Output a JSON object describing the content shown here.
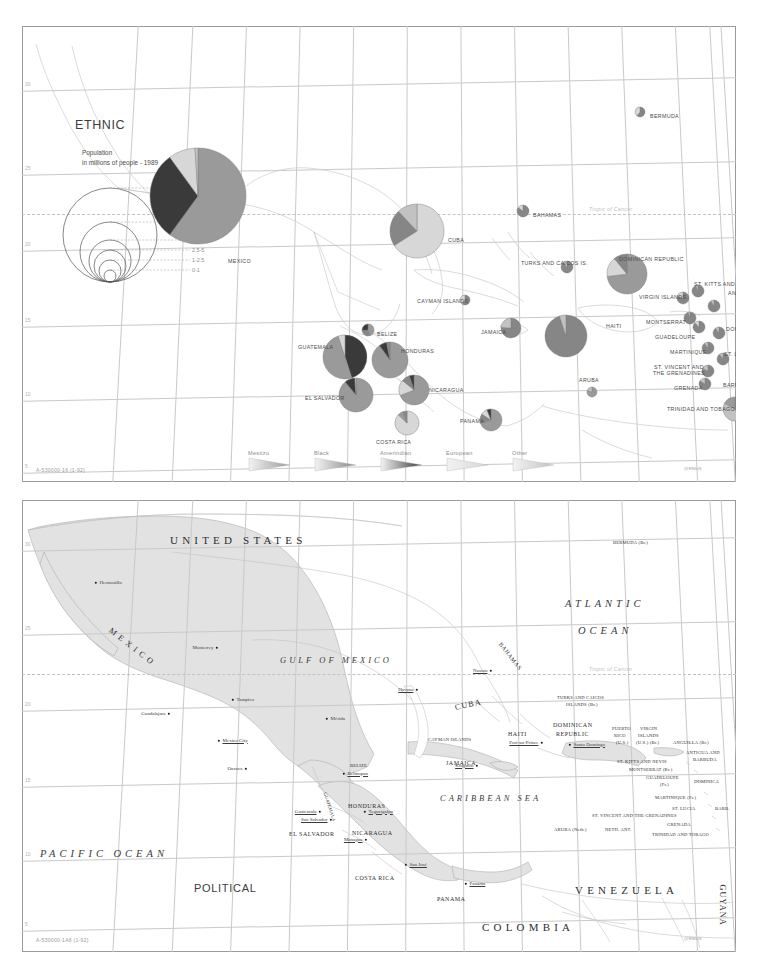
{
  "document": {
    "kind": "two-panel reference map sheet",
    "panels": [
      "ethnic",
      "political"
    ]
  },
  "ethnic": {
    "title": "ETHNIC",
    "population_caption_line1": "Population",
    "population_caption_line2": "in millions of people - 1989",
    "map_id": "A-530000-16   (1-92)",
    "credit": "@RMcN",
    "tropic_label": "Tropic of Cancer",
    "lon_ticks": [
      "115",
      "110",
      "105",
      "100",
      "95",
      "90",
      "85",
      "80",
      "75",
      "70",
      "65",
      "60",
      "55"
    ],
    "lat_ticks": [
      "30",
      "25",
      "20",
      "15",
      "10",
      "5"
    ],
    "size_key": [
      {
        "label": "25-100",
        "r": 47
      },
      {
        "label": "10-25",
        "r": 30
      },
      {
        "label": "5-10",
        "r": 21
      },
      {
        "label": "2.5-5",
        "r": 16
      },
      {
        "label": "1-2.5",
        "r": 11
      },
      {
        "label": "0-1",
        "r": 6
      }
    ],
    "legend": [
      {
        "label": "Mestizo",
        "color": "#9a9a9a"
      },
      {
        "label": "Black",
        "color": "#868686"
      },
      {
        "label": "Amerindian",
        "color": "#3a3a3a"
      },
      {
        "label": "European",
        "color": "#d7d7d7"
      },
      {
        "label": "Other",
        "color": "#c2c2c2"
      }
    ],
    "countries": [
      {
        "name": "MEXICO",
        "x": 176,
        "y": 170,
        "r": 48,
        "lx": 206,
        "ly": 232,
        "slices": [
          {
            "g": "Mestizo",
            "v": 60
          },
          {
            "g": "Amerindian",
            "v": 30
          },
          {
            "g": "European",
            "v": 9
          },
          {
            "g": "Other",
            "v": 1
          }
        ]
      },
      {
        "name": "CUBA",
        "x": 395,
        "y": 205,
        "r": 27,
        "lx": 426,
        "ly": 211,
        "slices": [
          {
            "g": "European",
            "v": 66
          },
          {
            "g": "Black",
            "v": 22
          },
          {
            "g": "Other",
            "v": 12
          }
        ]
      },
      {
        "name": "BAHAMAS",
        "x": 501,
        "y": 185,
        "r": 6,
        "lx": 511,
        "ly": 186,
        "slices": [
          {
            "g": "Black",
            "v": 85
          },
          {
            "g": "European",
            "v": 15
          }
        ]
      },
      {
        "name": "BERMUDA",
        "x": 618,
        "y": 86,
        "r": 5,
        "lx": 628,
        "ly": 87,
        "slices": [
          {
            "g": "Black",
            "v": 61
          },
          {
            "g": "European",
            "v": 39
          }
        ]
      },
      {
        "name": "TURKS AND CAICOS IS.",
        "x": 545,
        "y": 241,
        "r": 6,
        "lx": 499,
        "ly": 234,
        "slices": [
          {
            "g": "Black",
            "v": 90
          },
          {
            "g": "European",
            "v": 10
          }
        ]
      },
      {
        "name": "DOMINICAN REPUBLIC",
        "x": 605,
        "y": 248,
        "r": 20,
        "lx": 597,
        "ly": 230,
        "slices": [
          {
            "g": "Mestizo",
            "v": 73
          },
          {
            "g": "European",
            "v": 16
          },
          {
            "g": "Black",
            "v": 11
          }
        ]
      },
      {
        "name": "HAITI",
        "x": 544,
        "y": 310,
        "r": 21,
        "lx": 584,
        "ly": 297,
        "slices": [
          {
            "g": "Black",
            "v": 95
          },
          {
            "g": "Other",
            "v": 5
          }
        ]
      },
      {
        "name": "JAMAICA",
        "x": 489,
        "y": 302,
        "r": 10,
        "lx": 459,
        "ly": 303,
        "slices": [
          {
            "g": "Black",
            "v": 76
          },
          {
            "g": "Other",
            "v": 24
          }
        ]
      },
      {
        "name": "CAYMAN ISLANDS",
        "x": 443,
        "y": 274,
        "r": 5,
        "lx": 395,
        "ly": 272,
        "slices": [
          {
            "g": "Black",
            "v": 60
          },
          {
            "g": "European",
            "v": 40
          }
        ]
      },
      {
        "name": "BELIZE",
        "x": 346,
        "y": 304,
        "r": 6,
        "lx": 355,
        "ly": 305,
        "slices": [
          {
            "g": "Mestizo",
            "v": 44
          },
          {
            "g": "Black",
            "v": 30
          },
          {
            "g": "Amerindian",
            "v": 26
          }
        ]
      },
      {
        "name": "GUATEMALA",
        "x": 323,
        "y": 331,
        "r": 22,
        "lx": 276,
        "ly": 318,
        "slices": [
          {
            "g": "Amerindian",
            "v": 45
          },
          {
            "g": "Mestizo",
            "v": 50
          },
          {
            "g": "European",
            "v": 5
          }
        ]
      },
      {
        "name": "HONDURAS",
        "x": 368,
        "y": 334,
        "r": 18,
        "lx": 379,
        "ly": 322,
        "slices": [
          {
            "g": "Mestizo",
            "v": 90
          },
          {
            "g": "Amerindian",
            "v": 7
          },
          {
            "g": "Black",
            "v": 3
          }
        ]
      },
      {
        "name": "EL SALVADOR",
        "x": 334,
        "y": 369,
        "r": 17,
        "lx": 283,
        "ly": 369,
        "slices": [
          {
            "g": "Mestizo",
            "v": 89
          },
          {
            "g": "Amerindian",
            "v": 10
          },
          {
            "g": "European",
            "v": 1
          }
        ]
      },
      {
        "name": "NICARAGUA",
        "x": 392,
        "y": 364,
        "r": 15,
        "lx": 407,
        "ly": 361,
        "slices": [
          {
            "g": "Mestizo",
            "v": 69
          },
          {
            "g": "European",
            "v": 17
          },
          {
            "g": "Black",
            "v": 9
          },
          {
            "g": "Amerindian",
            "v": 5
          }
        ]
      },
      {
        "name": "COSTA RICA",
        "x": 385,
        "y": 397,
        "r": 12,
        "lx": 354,
        "ly": 413,
        "slices": [
          {
            "g": "European",
            "v": 87
          },
          {
            "g": "Mestizo",
            "v": 7
          },
          {
            "g": "Black",
            "v": 6
          }
        ]
      },
      {
        "name": "PANAMA",
        "x": 469,
        "y": 394,
        "r": 11,
        "lx": 438,
        "ly": 392,
        "slices": [
          {
            "g": "Mestizo",
            "v": 70
          },
          {
            "g": "Black",
            "v": 14
          },
          {
            "g": "European",
            "v": 10
          },
          {
            "g": "Amerindian",
            "v": 6
          }
        ]
      },
      {
        "name": "ARUBA",
        "x": 570,
        "y": 366,
        "r": 5,
        "lx": 557,
        "ly": 351,
        "slices": [
          {
            "g": "Mestizo",
            "v": 80
          },
          {
            "g": "Other",
            "v": 20
          }
        ]
      },
      {
        "name": "VIRGIN ISLANDS",
        "x": 661,
        "y": 272,
        "r": 6,
        "lx": 617,
        "ly": 268,
        "slices": [
          {
            "g": "Black",
            "v": 80
          },
          {
            "g": "European",
            "v": 20
          }
        ]
      },
      {
        "name": "ST. KITTS AND NEVIS",
        "x": 676,
        "y": 265,
        "r": 6,
        "lx": 672,
        "ly": 255,
        "slices": [
          {
            "g": "Black",
            "v": 94
          },
          {
            "g": "Other",
            "v": 6
          }
        ]
      },
      {
        "name": "ANTIGUA AND BARBUDA",
        "x": 692,
        "y": 280,
        "r": 6,
        "lx": 706,
        "ly": 264,
        "slices": [
          {
            "g": "Black",
            "v": 91
          },
          {
            "g": "Other",
            "v": 9
          }
        ]
      },
      {
        "name": "MONTSERRAT",
        "x": 668,
        "y": 292,
        "r": 6,
        "lx": 624,
        "ly": 293,
        "slices": [
          {
            "g": "Black",
            "v": 95
          },
          {
            "g": "Other",
            "v": 5
          }
        ]
      },
      {
        "name": "GUADELOUPE",
        "x": 677,
        "y": 301,
        "r": 6,
        "lx": 633,
        "ly": 308,
        "slices": [
          {
            "g": "Black",
            "v": 88
          },
          {
            "g": "European",
            "v": 12
          }
        ]
      },
      {
        "name": "DOMINICA",
        "x": 697,
        "y": 307,
        "r": 6,
        "lx": 704,
        "ly": 300,
        "slices": [
          {
            "g": "Black",
            "v": 90
          },
          {
            "g": "Other",
            "v": 10
          }
        ]
      },
      {
        "name": "MARTINIQUE",
        "x": 686,
        "y": 322,
        "r": 6,
        "lx": 648,
        "ly": 323,
        "slices": [
          {
            "g": "Black",
            "v": 90
          },
          {
            "g": "Other",
            "v": 10
          }
        ]
      },
      {
        "name": "ST. LUCIA",
        "x": 701,
        "y": 333,
        "r": 6,
        "lx": 702,
        "ly": 325,
        "slices": [
          {
            "g": "Black",
            "v": 90
          },
          {
            "g": "Other",
            "v": 10
          }
        ]
      },
      {
        "name": "ST. VINCENT AND THE GRENADINES",
        "x": 686,
        "y": 345,
        "r": 6,
        "lx": 627,
        "ly": 338,
        "slices": [
          {
            "g": "Black",
            "v": 82
          },
          {
            "g": "Other",
            "v": 18
          }
        ]
      },
      {
        "name": "BARBADOS",
        "x": 720,
        "y": 347,
        "r": 6,
        "lx": 701,
        "ly": 356,
        "slices": [
          {
            "g": "Black",
            "v": 92
          },
          {
            "g": "Other",
            "v": 8
          }
        ]
      },
      {
        "name": "GRENADA",
        "x": 683,
        "y": 358,
        "r": 6,
        "lx": 652,
        "ly": 359,
        "slices": [
          {
            "g": "Black",
            "v": 84
          },
          {
            "g": "Other",
            "v": 16
          }
        ]
      },
      {
        "name": "TRINIDAD AND TOBAGO",
        "x": 713,
        "y": 383,
        "r": 12,
        "lx": 645,
        "ly": 380,
        "slices": [
          {
            "g": "Black",
            "v": 43
          },
          {
            "g": "Other",
            "v": 40
          },
          {
            "g": "Mestizo",
            "v": 17
          }
        ]
      }
    ]
  },
  "political": {
    "title": "POLITICAL",
    "map_id": "A-530000-1A6   (1-92)",
    "credit": "@RMcN",
    "tropic_label": "Tropic of Cancer",
    "oceans": [
      {
        "text": "ATLANTIC",
        "x": 565,
        "y": 598,
        "size": "big"
      },
      {
        "text": "OCEAN",
        "x": 578,
        "y": 625,
        "size": "big"
      },
      {
        "text": "GULF OF MEXICO",
        "x": 280,
        "y": 655,
        "size": "mid"
      },
      {
        "text": "CARIBBEAN SEA",
        "x": 440,
        "y": 793,
        "size": "mid"
      },
      {
        "text": "PACIFIC OCEAN",
        "x": 40,
        "y": 848,
        "size": "big"
      }
    ],
    "countries": [
      {
        "text": "UNITED STATES",
        "x": 170,
        "y": 534,
        "cls": "p-big"
      },
      {
        "text": "M E X I C O",
        "x": 110,
        "y": 625,
        "cls": "p-mid",
        "rot": 38
      },
      {
        "text": "VENEZUELA",
        "x": 575,
        "y": 884,
        "cls": "p-big"
      },
      {
        "text": "COLOMBIA",
        "x": 482,
        "y": 921,
        "cls": "p-big"
      },
      {
        "text": "GUYANA",
        "x": 722,
        "y": 880,
        "cls": "p-mid",
        "rot": 90
      },
      {
        "text": "CUBA",
        "x": 455,
        "y": 703,
        "cls": "p-mid",
        "rot": -12
      },
      {
        "text": "BAHAMAS",
        "x": 500,
        "y": 640,
        "cls": "p-sm",
        "rot": 52
      },
      {
        "text": "HAITI",
        "x": 508,
        "y": 731,
        "cls": "p-sm"
      },
      {
        "text": "JAMAICA",
        "x": 446,
        "y": 760,
        "cls": "p-sm"
      },
      {
        "text": "DOMINICAN",
        "x": 553,
        "y": 722,
        "cls": "p-sm"
      },
      {
        "text": "REPUBLIC",
        "x": 556,
        "y": 731,
        "cls": "p-sm"
      },
      {
        "text": "HONDURAS",
        "x": 348,
        "y": 803,
        "cls": "p-sm"
      },
      {
        "text": "NICARAGUA",
        "x": 352,
        "y": 830,
        "cls": "p-sm"
      },
      {
        "text": "EL SALVADOR",
        "x": 289,
        "y": 831,
        "cls": "p-sm"
      },
      {
        "text": "COSTA RICA",
        "x": 355,
        "y": 875,
        "cls": "p-sm"
      },
      {
        "text": "PANAMA",
        "x": 437,
        "y": 896,
        "cls": "p-sm"
      },
      {
        "text": "GUATEMALA",
        "x": 325,
        "y": 790,
        "cls": "p-xs",
        "rot": 72
      },
      {
        "text": "BELIZE",
        "x": 350,
        "y": 763,
        "cls": "p-xs"
      },
      {
        "text": "BERMUDA (Br.)",
        "x": 613,
        "y": 540,
        "cls": "p-xs"
      },
      {
        "text": "TURKS AND CAICOS",
        "x": 557,
        "y": 695,
        "cls": "p-xs"
      },
      {
        "text": "ISLANDS (Br.)",
        "x": 566,
        "y": 702,
        "cls": "p-xs"
      },
      {
        "text": "CAYMAN ISLANDS",
        "x": 428,
        "y": 737,
        "cls": "p-xs"
      },
      {
        "text": "PUERTO",
        "x": 612,
        "y": 726,
        "cls": "p-xs"
      },
      {
        "text": "RICO",
        "x": 614,
        "y": 733,
        "cls": "p-xs"
      },
      {
        "text": "(U.S.)",
        "x": 616,
        "y": 740,
        "cls": "p-xs"
      },
      {
        "text": "VIRGIN",
        "x": 640,
        "y": 726,
        "cls": "p-xs"
      },
      {
        "text": "ISLANDS",
        "x": 638,
        "y": 733,
        "cls": "p-xs"
      },
      {
        "text": "(U.S.) (Br.)",
        "x": 636,
        "y": 740,
        "cls": "p-xs"
      },
      {
        "text": "ANGUILLA (Br.)",
        "x": 673,
        "y": 740,
        "cls": "p-xs"
      },
      {
        "text": "ANTIGUA AND",
        "x": 686,
        "y": 750,
        "cls": "p-xs"
      },
      {
        "text": "BARBUDA",
        "x": 693,
        "y": 757,
        "cls": "p-xs"
      },
      {
        "text": "ST. KITTS AND NEVIS",
        "x": 617,
        "y": 759,
        "cls": "p-xs"
      },
      {
        "text": "MONTSERRAT (Br.)",
        "x": 629,
        "y": 767,
        "cls": "p-xs"
      },
      {
        "text": "GUADELOUPE",
        "x": 646,
        "y": 775,
        "cls": "p-xs"
      },
      {
        "text": "(Fr.)",
        "x": 660,
        "y": 782,
        "cls": "p-xs"
      },
      {
        "text": "DOMINICA",
        "x": 694,
        "y": 779,
        "cls": "p-xs"
      },
      {
        "text": "MARTINIQUE (Fr.)",
        "x": 655,
        "y": 795,
        "cls": "p-xs"
      },
      {
        "text": "ST. LUCIA",
        "x": 672,
        "y": 806,
        "cls": "p-xs"
      },
      {
        "text": "BARB.",
        "x": 715,
        "y": 806,
        "cls": "p-xs"
      },
      {
        "text": "ST. VINCENT AND THE GRENADINES",
        "x": 592,
        "y": 813,
        "cls": "p-xs"
      },
      {
        "text": "GRENADA",
        "x": 667,
        "y": 822,
        "cls": "p-xs"
      },
      {
        "text": "ARUBA (Neth.)",
        "x": 554,
        "y": 827,
        "cls": "p-xs"
      },
      {
        "text": "NETH. ANT.",
        "x": 605,
        "y": 827,
        "cls": "p-xs"
      },
      {
        "text": "TRINIDAD AND TOBAGO",
        "x": 652,
        "y": 832,
        "cls": "p-xs"
      }
    ],
    "cities": [
      {
        "name": "Hermosillo",
        "x": 96,
        "y": 583,
        "cap": false,
        "side": "right"
      },
      {
        "name": "Monterrey",
        "x": 217,
        "y": 648,
        "cap": false,
        "side": "left"
      },
      {
        "name": "Tampico",
        "x": 233,
        "y": 700,
        "cap": false,
        "side": "right"
      },
      {
        "name": "Guadalajara",
        "x": 169,
        "y": 714,
        "cap": false,
        "side": "left"
      },
      {
        "name": "Mexico City",
        "x": 219,
        "y": 741,
        "cap": true,
        "side": "right"
      },
      {
        "name": "Oaxaca",
        "x": 246,
        "y": 769,
        "cap": false,
        "side": "left"
      },
      {
        "name": "Mérida",
        "x": 327,
        "y": 719,
        "cap": false,
        "side": "right"
      },
      {
        "name": "Belmopan",
        "x": 344,
        "y": 774,
        "cap": true,
        "side": "right"
      },
      {
        "name": "Guatemala",
        "x": 320,
        "y": 812,
        "cap": true,
        "side": "left"
      },
      {
        "name": "San Salvador",
        "x": 331,
        "y": 820,
        "cap": true,
        "side": "left"
      },
      {
        "name": "Tegucigalpa",
        "x": 365,
        "y": 812,
        "cap": true,
        "side": "right"
      },
      {
        "name": "Managua",
        "x": 366,
        "y": 840,
        "cap": true,
        "side": "left"
      },
      {
        "name": "San José",
        "x": 406,
        "y": 865,
        "cap": true,
        "side": "right"
      },
      {
        "name": "Panama",
        "x": 466,
        "y": 884,
        "cap": true,
        "side": "right"
      },
      {
        "name": "Nassau",
        "x": 491,
        "y": 671,
        "cap": true,
        "side": "left"
      },
      {
        "name": "Havana",
        "x": 417,
        "y": 690,
        "cap": true,
        "side": "left"
      },
      {
        "name": "Kingston",
        "x": 477,
        "y": 766,
        "cap": true,
        "side": "left"
      },
      {
        "name": "Port-au-Prince",
        "x": 542,
        "y": 743,
        "cap": true,
        "side": "left"
      },
      {
        "name": "Santo Domingo",
        "x": 570,
        "y": 745,
        "cap": true,
        "side": "right"
      }
    ],
    "lon_ticks": [
      "115",
      "110",
      "105",
      "100",
      "95",
      "90",
      "85",
      "80",
      "75",
      "70",
      "65",
      "60",
      "55"
    ],
    "lat_ticks": [
      "30",
      "25",
      "20",
      "15",
      "10",
      "5"
    ]
  }
}
